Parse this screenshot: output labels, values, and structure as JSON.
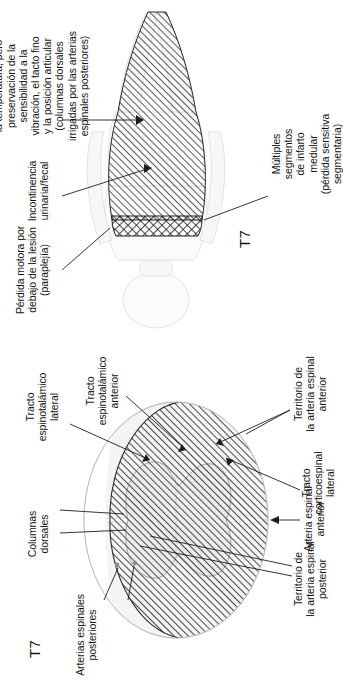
{
  "figure": {
    "language": "es",
    "orientation": "rotated-90-ccw",
    "ink_color": "#141414",
    "paper_color": "#ffffff"
  },
  "panels": [
    {
      "id": "spinal-cord-cross-section",
      "level_label": "T7",
      "labels": [
        {
          "name": "arterias-espinales-posteriores",
          "text": "Arterias espinales\nposteriores"
        },
        {
          "name": "columnas-dorsales",
          "text": "Columnas\ndorsales"
        },
        {
          "name": "tracto-espinotalamico-lateral",
          "text": "Tracto\nespinotalámico\nlateral"
        },
        {
          "name": "tracto-espinotalamico-anterior",
          "text": "Tracto\nespinotalámico\nanterior"
        },
        {
          "name": "arteria-espinal-anterior",
          "text": "Arteria espinal\nanterior"
        },
        {
          "name": "territorio-arteria-espinal-posterior",
          "text": "Territorio de\nla arteria espinal\nposterior"
        },
        {
          "name": "tracto-corticoespinal-lateral",
          "text": "Tracto\ncorticoespinal\nlateral"
        },
        {
          "name": "territorio-arteria-espinal-anterior",
          "text": "Territorio de\nla arteria espinal\nanterior"
        }
      ]
    },
    {
      "id": "body-dermatome-figure",
      "level_label": "T7",
      "labels": [
        {
          "name": "perdida-motora",
          "text": "Pérdida motora por\ndebajo de la lesión\n(paraplejía)"
        },
        {
          "name": "incontinencia",
          "text": "Incontinencia\nurinaria/fecal"
        },
        {
          "name": "perdida-sensibilidad",
          "text": "Pérdida de la\nsensibilidad al dolor y\nla temperatura, pero\npreservación de la\nsensibilidad a la\nvibración, el tacto fino\ny la posición articular\n(columnas dorsales\nirrigadas por las arterias\nespinales posteriores)"
        },
        {
          "name": "multiples-segmentos-infarto",
          "text": "Múltiples\nsegmentos\nde infarto\nmedular\n(pérdida sensitiva\nsegmentaria)"
        }
      ]
    }
  ]
}
